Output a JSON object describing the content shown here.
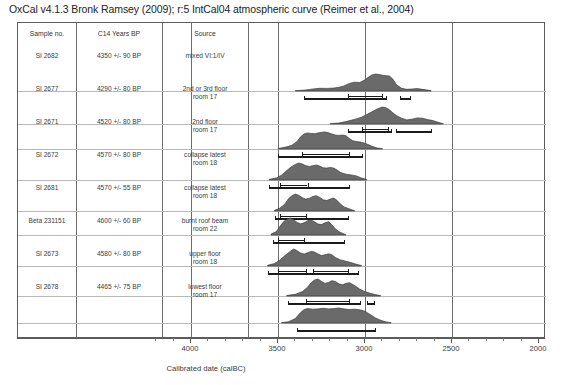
{
  "title": "OxCal v4.1.3 Bronk Ramsey (2009); r:5 IntCal04 atmospheric curve (Reimer et al., 2004)",
  "table": {
    "headers": [
      "Sample no.",
      "C14 Years BP",
      "Source"
    ],
    "rows": [
      {
        "sample": "SI 2682",
        "c14": "4350 +/- 90 BP",
        "source": "mixed VI:1/IV"
      },
      {
        "sample": "SI 2677",
        "c14": "4290 +/- 80 BP",
        "source": "2nd or 3rd floor\nroom 17"
      },
      {
        "sample": "SI 2671",
        "c14": "4520 +/- 80 BP",
        "source": "2nd floor\nroom 17"
      },
      {
        "sample": "SI 2672",
        "c14": "4570 +/- 80 BP",
        "source": "collapse latest\nroom 18"
      },
      {
        "sample": "SI 2681",
        "c14": "4570 +/- 55 BP",
        "source": "collapse latest\nroom 18"
      },
      {
        "sample": "Beta 231151",
        "c14": "4600 +/- 60 BP",
        "source": "burnt roof beam\nroom 22"
      },
      {
        "sample": "SI 2673",
        "c14": "4580 +/- 80 BP",
        "source": "upper floor\nroom 18"
      },
      {
        "sample": "SI 2678",
        "c14": "4465 +/- 75 BP",
        "source": "lowest floor\nroom 17"
      }
    ]
  },
  "axis": {
    "label": "Calibrated date (calBC)",
    "ticks": [
      "4000",
      "3500",
      "3000",
      "2500",
      "2000"
    ],
    "min": 2000,
    "max": 4200,
    "reversed": true,
    "minor_step": 100
  },
  "colors": {
    "distribution_fill": "#6a6a6a",
    "distribution_edge": "#3d3d3d",
    "range_bar": "#1b1b1b",
    "gridline": "#6d6d6d",
    "baseline": "#b9b9b9",
    "frame": "#5d5d5d"
  },
  "chart_data": {
    "type": "area",
    "title": "OxCal v4.1.3 Bronk Ramsey (2009); r:5 IntCal04 atmospheric curve (Reimer et al., 2004)",
    "xlabel": "Calibrated date (calBC)",
    "ylabel": "",
    "xlim": [
      4200,
      2000
    ],
    "x_reversed": true,
    "gridlines": [
      4000,
      3500,
      3000,
      2500
    ],
    "legend": "none",
    "note": "Radiocarbon calibration probability distributions; each row is one sample. Bars below each curve are 68.2% and 95.4% confidence ranges (calBC).",
    "series": [
      {
        "name": "SI 2682",
        "c14_age": 4350,
        "c14_error": 90,
        "source": "mixed VI:1/IV",
        "curve_x": [
          3400,
          3340,
          3300,
          3260,
          3220,
          3180,
          3150,
          3120,
          3090,
          3060,
          3030,
          3000,
          2980,
          2960,
          2940,
          2920,
          2900,
          2880,
          2860,
          2840,
          2820,
          2790,
          2760,
          2730,
          2700,
          2660,
          2620
        ],
        "curve_y": [
          0.02,
          0.06,
          0.12,
          0.16,
          0.15,
          0.17,
          0.22,
          0.3,
          0.45,
          0.52,
          0.5,
          0.66,
          0.82,
          0.95,
          1.0,
          0.97,
          0.93,
          0.9,
          0.88,
          0.7,
          0.38,
          0.16,
          0.1,
          0.12,
          0.14,
          0.08,
          0.02
        ],
        "ranges_68": [
          [
            3100,
            2900
          ]
        ],
        "ranges_95": [
          [
            3350,
            2880
          ],
          [
            2800,
            2740
          ]
        ]
      },
      {
        "name": "SI 2677",
        "c14_age": 4290,
        "c14_error": 80,
        "source": "2nd or 3rd floor room 17",
        "curve_x": [
          3200,
          3150,
          3110,
          3080,
          3050,
          3020,
          2990,
          2960,
          2930,
          2900,
          2880,
          2860,
          2840,
          2820,
          2790,
          2760,
          2730,
          2700,
          2670,
          2640,
          2610,
          2580,
          2550
        ],
        "curve_y": [
          0.02,
          0.06,
          0.14,
          0.22,
          0.3,
          0.4,
          0.55,
          0.72,
          0.88,
          1.0,
          0.96,
          0.84,
          0.66,
          0.5,
          0.34,
          0.24,
          0.28,
          0.36,
          0.34,
          0.26,
          0.2,
          0.1,
          0.02
        ],
        "ranges_68": [
          [
            3020,
            2870
          ]
        ],
        "ranges_95": [
          [
            3100,
            2850
          ],
          [
            2820,
            2620
          ]
        ]
      },
      {
        "name": "SI 2671",
        "c14_age": 4520,
        "c14_error": 80,
        "source": "2nd floor room 17",
        "curve_x": [
          3500,
          3460,
          3420,
          3390,
          3370,
          3350,
          3330,
          3310,
          3290,
          3270,
          3250,
          3230,
          3210,
          3190,
          3170,
          3150,
          3130,
          3110,
          3090,
          3070,
          3050,
          3020,
          2990,
          2960,
          2930,
          2900
        ],
        "curve_y": [
          0.03,
          0.1,
          0.22,
          0.45,
          0.72,
          0.88,
          0.95,
          0.92,
          0.9,
          0.94,
          0.98,
          1.0,
          0.96,
          0.88,
          0.82,
          0.8,
          0.82,
          0.78,
          0.62,
          0.48,
          0.44,
          0.4,
          0.3,
          0.16,
          0.06,
          0.02
        ],
        "ranges_68": [
          [
            3360,
            3090
          ]
        ],
        "ranges_95": [
          [
            3500,
            3020
          ]
        ]
      },
      {
        "name": "SI 2672",
        "c14_age": 4570,
        "c14_error": 80,
        "source": "collapse latest room 18",
        "curve_x": [
          3550,
          3510,
          3480,
          3450,
          3420,
          3400,
          3380,
          3360,
          3340,
          3320,
          3300,
          3280,
          3260,
          3240,
          3220,
          3200,
          3180,
          3160,
          3140,
          3110,
          3080,
          3050,
          3020,
          2990
        ],
        "curve_y": [
          0.04,
          0.12,
          0.28,
          0.56,
          0.8,
          0.92,
          1.0,
          0.94,
          0.84,
          0.8,
          0.84,
          0.88,
          0.82,
          0.72,
          0.7,
          0.74,
          0.7,
          0.58,
          0.44,
          0.34,
          0.3,
          0.24,
          0.12,
          0.03
        ],
        "ranges_68": [
          [
            3490,
            3330
          ]
        ],
        "ranges_95": [
          [
            3550,
            3090
          ]
        ]
      },
      {
        "name": "SI 2681",
        "c14_age": 4570,
        "c14_error": 55,
        "source": "collapse latest room 18",
        "curve_x": [
          3520,
          3490,
          3460,
          3440,
          3420,
          3400,
          3380,
          3360,
          3340,
          3320,
          3300,
          3280,
          3260,
          3240,
          3220,
          3200,
          3180,
          3160,
          3140,
          3120,
          3100,
          3080,
          3060
        ],
        "curve_y": [
          0.04,
          0.16,
          0.42,
          0.72,
          0.9,
          1.0,
          0.92,
          0.78,
          0.7,
          0.74,
          0.86,
          0.9,
          0.8,
          0.66,
          0.62,
          0.7,
          0.76,
          0.62,
          0.4,
          0.24,
          0.16,
          0.08,
          0.02
        ],
        "ranges_68": [
          [
            3490,
            3340
          ]
        ],
        "ranges_95": [
          [
            3520,
            3100
          ]
        ]
      },
      {
        "name": "Beta 231151",
        "c14_age": 4600,
        "c14_error": 60,
        "source": "burnt roof beam room 22",
        "curve_x": [
          3540,
          3510,
          3490,
          3470,
          3450,
          3430,
          3410,
          3390,
          3370,
          3350,
          3330,
          3310,
          3290,
          3270,
          3250,
          3230,
          3210,
          3190,
          3170,
          3150,
          3130,
          3110
        ],
        "curve_y": [
          0.05,
          0.2,
          0.48,
          0.76,
          0.92,
          1.0,
          0.9,
          0.74,
          0.66,
          0.72,
          0.84,
          0.88,
          0.78,
          0.64,
          0.62,
          0.72,
          0.78,
          0.6,
          0.36,
          0.2,
          0.1,
          0.02
        ],
        "ranges_68": [
          [
            3500,
            3350
          ]
        ],
        "ranges_95": [
          [
            3530,
            3120
          ]
        ]
      },
      {
        "name": "SI 2673",
        "c14_age": 4580,
        "c14_error": 80,
        "source": "upper floor room 18",
        "curve_x": [
          3560,
          3520,
          3490,
          3460,
          3430,
          3410,
          3390,
          3370,
          3350,
          3330,
          3310,
          3290,
          3270,
          3250,
          3230,
          3210,
          3190,
          3170,
          3140,
          3110,
          3080,
          3050,
          3020
        ],
        "curve_y": [
          0.04,
          0.14,
          0.34,
          0.62,
          0.86,
          1.0,
          0.9,
          0.76,
          0.7,
          0.78,
          0.86,
          0.82,
          0.7,
          0.62,
          0.66,
          0.72,
          0.66,
          0.5,
          0.36,
          0.28,
          0.2,
          0.1,
          0.03
        ],
        "ranges_68": [
          [
            3500,
            3340
          ],
          [
            3300,
            3100
          ]
        ],
        "ranges_95": [
          [
            3560,
            3040
          ]
        ]
      },
      {
        "name": "SI 2678",
        "c14_age": 4465,
        "c14_error": 75,
        "source": "lowest floor room 17",
        "curve_x": [
          3450,
          3400,
          3360,
          3330,
          3310,
          3290,
          3270,
          3250,
          3230,
          3210,
          3190,
          3170,
          3150,
          3130,
          3110,
          3090,
          3060,
          3030,
          3000,
          2970,
          2940,
          2910
        ],
        "curve_y": [
          0.03,
          0.1,
          0.26,
          0.52,
          0.78,
          0.94,
          1.0,
          0.86,
          0.74,
          0.8,
          0.9,
          0.86,
          0.72,
          0.66,
          0.74,
          0.78,
          0.62,
          0.4,
          0.26,
          0.16,
          0.08,
          0.02
        ],
        "ranges_68": [
          [
            3340,
            3090
          ]
        ],
        "ranges_95": [
          [
            3440,
            3030
          ],
          [
            2990,
            2950
          ]
        ]
      },
      {
        "name": "Sum",
        "c14_age": null,
        "c14_error": null,
        "source": "",
        "curve_x": [
          3480,
          3440,
          3400,
          3370,
          3350,
          3330,
          3300,
          3270,
          3240,
          3210,
          3180,
          3150,
          3120,
          3090,
          3060,
          3030,
          3000,
          2970,
          2940,
          2910,
          2880,
          2850
        ],
        "curve_y": [
          0.02,
          0.08,
          0.3,
          0.7,
          0.9,
          0.96,
          0.92,
          0.94,
          0.98,
          0.94,
          0.96,
          1.0,
          0.94,
          0.9,
          0.92,
          0.88,
          0.78,
          0.56,
          0.34,
          0.18,
          0.07,
          0.02
        ],
        "ranges_68": [],
        "ranges_95": [
          [
            3390,
            2940
          ]
        ]
      }
    ]
  }
}
